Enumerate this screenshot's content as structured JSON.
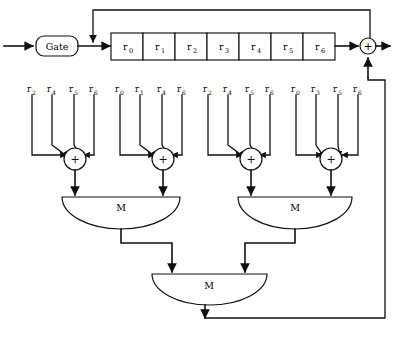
{
  "figure": {
    "type": "majority-logic-threshold-decoder",
    "background_color": "#ffffff",
    "line_color": "#111111"
  },
  "input_gate": {
    "label": "Gate",
    "shape": "rounded-rectangle"
  },
  "shift_register": {
    "cell_count": 7,
    "cells": [
      {
        "base": "r",
        "sub": "0"
      },
      {
        "base": "r",
        "sub": "1"
      },
      {
        "base": "r",
        "sub": "2"
      },
      {
        "base": "r",
        "sub": "3"
      },
      {
        "base": "r",
        "sub": "4"
      },
      {
        "base": "r",
        "sub": "5"
      },
      {
        "base": "r",
        "sub": "6"
      }
    ]
  },
  "output_adder": {
    "symbol": "+"
  },
  "adders": [
    {
      "symbol": "+"
    },
    {
      "symbol": "+"
    },
    {
      "symbol": "+"
    },
    {
      "symbol": "+"
    }
  ],
  "tap_groups": [
    {
      "adder_index": 0,
      "taps": [
        {
          "base": "r",
          "sub": "2"
        },
        {
          "base": "r",
          "sub": "4"
        },
        {
          "base": "r",
          "sub": "5"
        },
        {
          "base": "r",
          "sub": "6"
        }
      ]
    },
    {
      "adder_index": 1,
      "taps": [
        {
          "base": "r",
          "sub": "0"
        },
        {
          "base": "r",
          "sub": "1"
        },
        {
          "base": "r",
          "sub": "4"
        },
        {
          "base": "r",
          "sub": "6"
        }
      ]
    },
    {
      "adder_index": 2,
      "taps": [
        {
          "base": "r",
          "sub": "2"
        },
        {
          "base": "r",
          "sub": "4"
        },
        {
          "base": "r",
          "sub": "5"
        },
        {
          "base": "r",
          "sub": "6"
        }
      ]
    },
    {
      "adder_index": 3,
      "taps": [
        {
          "base": "r",
          "sub": "0"
        },
        {
          "base": "r",
          "sub": "3"
        },
        {
          "base": "r",
          "sub": "5"
        },
        {
          "base": "r",
          "sub": "6"
        }
      ]
    }
  ],
  "majority_gates": [
    {
      "label": "M",
      "level": "first",
      "position": "left"
    },
    {
      "label": "M",
      "level": "first",
      "position": "right"
    },
    {
      "label": "M",
      "level": "second",
      "position": "center"
    }
  ]
}
